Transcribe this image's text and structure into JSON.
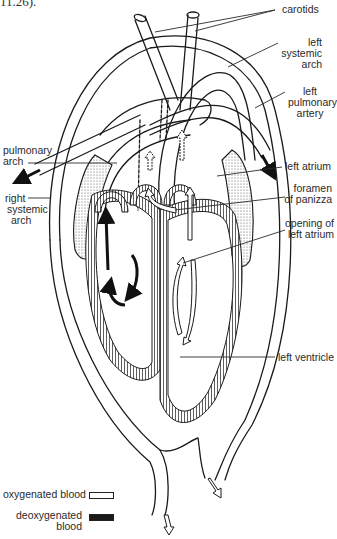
{
  "header": {
    "clipped_text": "11.26)."
  },
  "labels": {
    "carotids": "carotids",
    "left_systemic_arch": [
      "left",
      "systemic",
      "arch"
    ],
    "left_pulmonary_artery": [
      "left",
      "pulmonary",
      "artery"
    ],
    "pulmonary_arch": [
      "pulmonary",
      "arch"
    ],
    "left_atrium": "left atrium",
    "foramen_of_panizza": [
      "foramen",
      "of panizza"
    ],
    "right_systemic_arch": [
      "right",
      "systemic",
      "arch"
    ],
    "opening_of_left_atrium": [
      "opening of",
      "left atrium"
    ],
    "left_ventricle": "left ventricle"
  },
  "legend": {
    "oxygenated": {
      "label": "oxygenated blood",
      "color": "#ffffff"
    },
    "deoxygenated": {
      "label": [
        "deoxygenated",
        "blood"
      ],
      "color": "#1a1a1a"
    }
  },
  "colors": {
    "line": "#1a1a1a",
    "stipple": "#b8b8b8",
    "bg": "#ffffff"
  }
}
